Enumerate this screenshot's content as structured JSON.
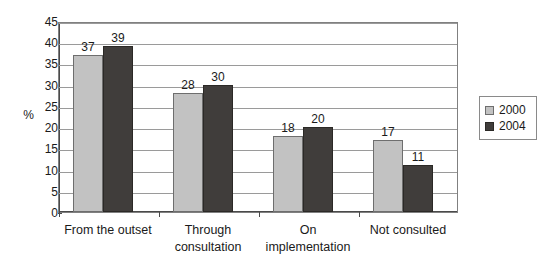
{
  "chart_data": {
    "type": "bar",
    "title": "",
    "xlabel": "",
    "ylabel": "%",
    "ylim": [
      0,
      45
    ],
    "ytick_step": 5,
    "yticks": [
      45,
      40,
      35,
      30,
      25,
      20,
      15,
      10,
      5,
      0
    ],
    "grid": true,
    "legend_position": "right",
    "categories": [
      "From the outset",
      "Through consultation",
      "On implementation",
      "Not consulted"
    ],
    "category_lines": [
      [
        "From the outset"
      ],
      [
        "Through",
        "consultation"
      ],
      [
        "On",
        "implementation"
      ],
      [
        "Not consulted"
      ]
    ],
    "series": [
      {
        "name": "2000",
        "color": "#c2c2c2",
        "values": [
          37,
          28,
          18,
          17
        ]
      },
      {
        "name": "2004",
        "color": "#403d3b",
        "values": [
          39,
          30,
          20,
          11
        ]
      }
    ]
  }
}
